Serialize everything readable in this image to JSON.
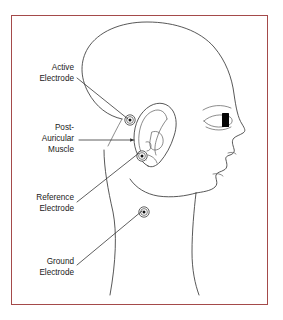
{
  "figure": {
    "frame_color": "#a44a4a",
    "background_color": "#ffffff",
    "line_color": "#3a3a3a",
    "text_color": "#1a1a1a"
  },
  "labels": [
    {
      "id": "active-electrode",
      "line1": "Active",
      "line2": "Electrode",
      "text_x": 74,
      "text_y1": 68,
      "text_y2": 79,
      "leader": {
        "x1": 77,
        "y1": 78,
        "x2": 128,
        "y2": 119
      },
      "arrow": false
    },
    {
      "id": "post-auricular-muscle",
      "line1": "Post-",
      "line2": "Auricular",
      "line3": "Muscle",
      "text_x": 74,
      "text_y1": 128,
      "text_y2": 139,
      "text_y3": 150,
      "leader": {
        "x1": 79,
        "y1": 140,
        "x2": 134,
        "y2": 140
      },
      "arrow": true
    },
    {
      "id": "reference-electrode",
      "line1": "Reference",
      "line2": "Electrode",
      "text_x": 74,
      "text_y1": 198,
      "text_y2": 209,
      "leader": {
        "x1": 77,
        "y1": 202,
        "x2": 139,
        "y2": 153
      },
      "arrow": false
    },
    {
      "id": "ground-electrode",
      "line1": "Ground",
      "line2": "Electrode",
      "text_x": 74,
      "text_y1": 262,
      "text_y2": 273,
      "leader": {
        "x1": 77,
        "y1": 265,
        "x2": 142,
        "y2": 211
      },
      "arrow": false
    }
  ],
  "electrodes": [
    {
      "id": "active",
      "cx": 130,
      "cy": 120,
      "r_outer": 5.2,
      "r_mid": 3.4,
      "r_dot": 1.5
    },
    {
      "id": "reference",
      "cx": 142,
      "cy": 156,
      "r_outer": 5.2,
      "r_mid": 3.4,
      "r_dot": 1.5
    },
    {
      "id": "ground",
      "cx": 144,
      "cy": 212,
      "r_outer": 5.2,
      "r_mid": 3.4,
      "r_dot": 1.5
    }
  ],
  "anatomy": {
    "parts": [
      "skull-outline",
      "ear-outline",
      "ear-helix",
      "ear-antihelix",
      "ear-tragus",
      "ear-lobe",
      "eyebrow",
      "eye",
      "pupil",
      "nose",
      "nostril",
      "lips",
      "chin",
      "jawline",
      "neck-front",
      "neck-back",
      "hairline"
    ]
  }
}
